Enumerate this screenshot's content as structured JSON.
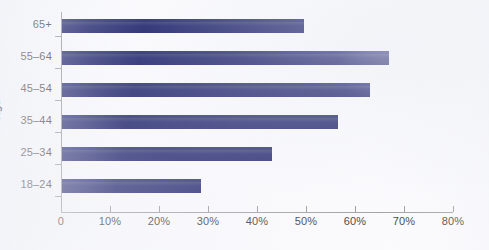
{
  "chart_data": {
    "type": "bar",
    "orientation": "horizontal",
    "title": "",
    "xlabel": "",
    "ylabel": "Age",
    "categories": [
      "18–24",
      "25–34",
      "35–44",
      "45–54",
      "55–64",
      "65+"
    ],
    "values": [
      28.5,
      43.0,
      56.5,
      63.0,
      67.0,
      49.5
    ],
    "xlim": [
      0,
      80
    ],
    "xticks": [
      0,
      10,
      20,
      30,
      40,
      50,
      60,
      70,
      80
    ],
    "xticklabels": [
      "0",
      "10%",
      "20%",
      "30%",
      "40%",
      "50%",
      "60%",
      "70%",
      "80%"
    ],
    "grid": false,
    "legend": null,
    "bar_color": "#272b73",
    "background_color": "#fbfbfd",
    "axis_color": "#9a9a9c",
    "text_color": "#3b3b3d"
  },
  "axis": {
    "y_title": "Age"
  }
}
